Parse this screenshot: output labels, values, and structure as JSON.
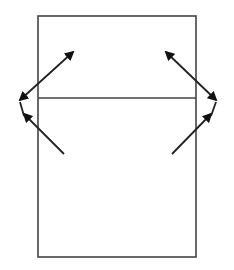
{
  "diagram": {
    "type": "ray-reflection-diagram",
    "background": "#ffffff",
    "stroke_color": "#222222",
    "rectangle": {
      "x": 38,
      "y": 16,
      "width": 158,
      "height": 241,
      "stroke": "#444444"
    },
    "divider": {
      "x1": 38,
      "y1": 98,
      "x2": 196,
      "y2": 98,
      "stroke": "#444444"
    },
    "arrows": [
      {
        "name": "left-upper-double-arrow",
        "x1": 20,
        "y1": 100,
        "x2": 73,
        "y2": 52,
        "heads": "both"
      },
      {
        "name": "left-lower-arrow",
        "x1": 64,
        "y1": 154,
        "x2": 24,
        "y2": 114,
        "heads": "end"
      },
      {
        "name": "left-connector",
        "x1": 24,
        "y1": 116,
        "x2": 20,
        "y2": 102,
        "heads": "none"
      },
      {
        "name": "right-upper-double-arrow",
        "x1": 166,
        "y1": 52,
        "x2": 216,
        "y2": 100,
        "heads": "both"
      },
      {
        "name": "right-lower-arrow",
        "x1": 172,
        "y1": 154,
        "x2": 211,
        "y2": 114,
        "heads": "end"
      },
      {
        "name": "right-connector",
        "x1": 211,
        "y1": 116,
        "x2": 216,
        "y2": 102,
        "heads": "none"
      }
    ]
  }
}
